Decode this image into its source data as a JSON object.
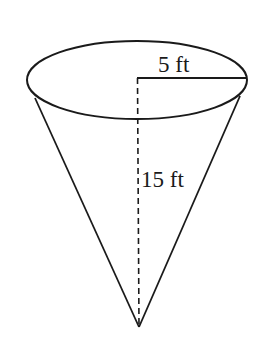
{
  "diagram": {
    "type": "cone",
    "stroke_color": "#1a1a1a",
    "background": "#ffffff",
    "labels": {
      "radius": "5 ft",
      "height": "15 ft"
    },
    "measurements": {
      "radius_value": 5,
      "height_value": 15,
      "unit": "ft"
    },
    "elements": [
      "circular-top-ellipse",
      "slant-side-left",
      "slant-side-right",
      "radius-line",
      "height-dashed-line",
      "apex"
    ]
  }
}
